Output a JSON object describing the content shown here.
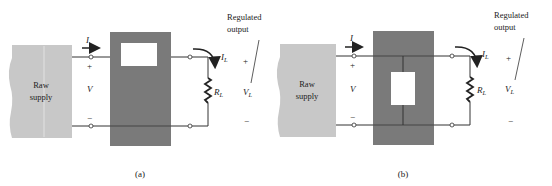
{
  "colors": {
    "raw_supply": "#c8c8c8",
    "regulator": "#7a7a7a",
    "inner": "#ffffff",
    "wire": "#333333"
  },
  "panels": [
    {
      "id": "a",
      "caption": "(a)",
      "raw_supply_label_1": "Raw",
      "raw_supply_label_2": "supply",
      "input_current": "I",
      "input_plus": "+",
      "input_voltage": "V",
      "input_minus": "−",
      "load_current": "I",
      "load_current_sub": "L",
      "load_resistor": "R",
      "load_resistor_sub": "L",
      "output_plus": "+",
      "output_voltage": "V",
      "output_voltage_sub": "L",
      "output_minus": "−",
      "regulated_1": "Regulated",
      "regulated_2": "output",
      "element_type": "series"
    },
    {
      "id": "b",
      "caption": "(b)",
      "raw_supply_label_1": "Raw",
      "raw_supply_label_2": "supply",
      "input_current": "I",
      "input_plus": "+",
      "input_voltage": "V",
      "input_minus": "−",
      "load_current": "I",
      "load_current_sub": "L",
      "load_resistor": "R",
      "load_resistor_sub": "L",
      "output_plus": "+",
      "output_voltage": "V",
      "output_voltage_sub": "L",
      "output_minus": "−",
      "regulated_1": "Regulated",
      "regulated_2": "output",
      "element_type": "shunt"
    }
  ]
}
